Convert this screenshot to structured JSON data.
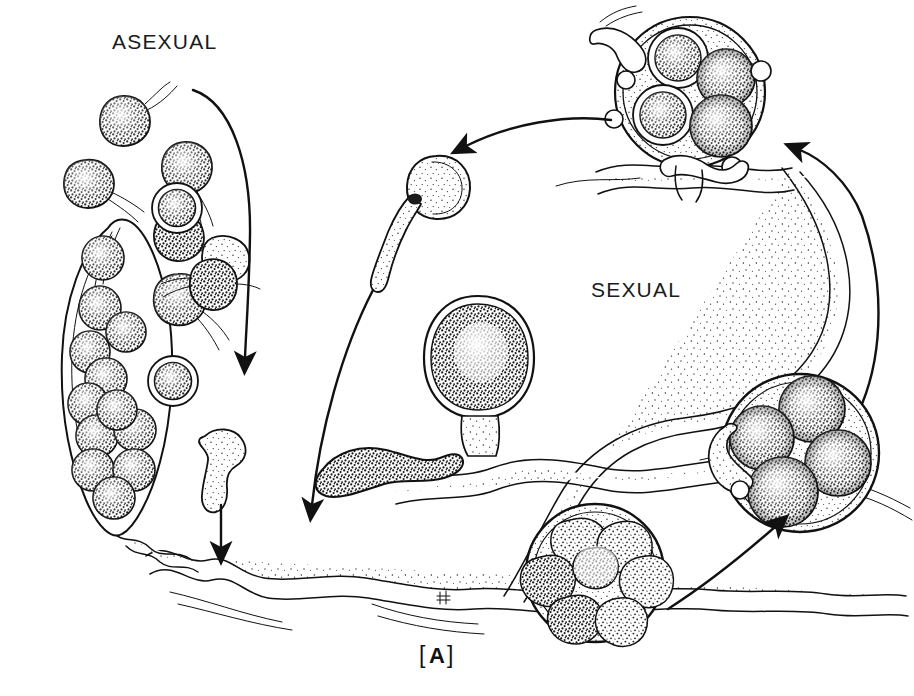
{
  "figure": {
    "plate_label_open": "[",
    "plate_label": "A",
    "plate_label_close": "]",
    "plate_label_full": "[A]",
    "background_color": "#ffffff",
    "ink_color": "#111111",
    "style": "pen-and-ink stipple line drawing"
  },
  "labels": {
    "asexual": "ASEXUAL",
    "sexual": "SEXUAL"
  },
  "signature": {
    "mark": "H"
  },
  "diagram_data": {
    "type": "cycle-diagram",
    "title": "Life cycle of an oomycete showing asexual and sexual pathways",
    "halves": [
      {
        "name": "asexual",
        "label": "ASEXUAL",
        "label_position": {
          "x": 160,
          "y": 72
        },
        "side": "left",
        "stage_count": 5
      },
      {
        "name": "sexual",
        "label": "SEXUAL",
        "label_position": {
          "x": 625,
          "y": 289
        },
        "side": "right",
        "stage_count": 5
      }
    ],
    "stages": [
      {
        "id": "sporangium",
        "pathway": "asexual",
        "name": "zoosporangium",
        "shape": "elongate-lemon",
        "center": {
          "x": 112,
          "y": 390
        },
        "width": 110,
        "height": 330,
        "spore_count": 12,
        "notes": "borne terminally on a hypha; packed with stippled spores"
      },
      {
        "id": "zoospores",
        "pathway": "asexual",
        "name": "biflagellate zoospores",
        "shape": "reniform-pip",
        "count": 7,
        "flagella_per_cell": 2,
        "positions": [
          {
            "x": 124,
            "y": 115
          },
          {
            "x": 186,
            "y": 157
          },
          {
            "x": 88,
            "y": 176
          },
          {
            "x": 178,
            "y": 234
          },
          {
            "x": 178,
            "y": 294
          },
          {
            "x": 222,
            "y": 252
          },
          {
            "x": 206,
            "y": 450
          }
        ]
      },
      {
        "id": "cysts",
        "pathway": "asexual",
        "name": "encysted zoospores",
        "shape": "double-walled-sphere",
        "count": 2,
        "positions": [
          {
            "x": 177,
            "y": 208
          },
          {
            "x": 173,
            "y": 381
          }
        ]
      },
      {
        "id": "amoeboid",
        "pathway": "asexual",
        "name": "amoeboid germling",
        "shape": "lobed-comma",
        "center": {
          "x": 221,
          "y": 455
        }
      },
      {
        "id": "germ-tube-cyst",
        "pathway": "shared",
        "name": "germinating cyst with germ tube",
        "shape": "sphere-with-tube",
        "center": {
          "x": 438,
          "y": 188
        },
        "tube_length": 95
      },
      {
        "id": "young-oogonium",
        "pathway": "sexual",
        "name": "young oogonium with antheridium",
        "shape": "ovoid-on-stalk",
        "center": {
          "x": 478,
          "y": 358
        },
        "width": 96,
        "height": 120
      },
      {
        "id": "antheridium-branch",
        "pathway": "sexual",
        "name": "antheridium branch",
        "shape": "club-lobe",
        "center": {
          "x": 372,
          "y": 470
        }
      },
      {
        "id": "oogonium-multispore",
        "pathway": "sexual",
        "name": "oogonium with developing oospores",
        "shape": "sphere",
        "center": {
          "x": 595,
          "y": 573
        },
        "radius": 68,
        "oospore_count": 7
      },
      {
        "id": "oogonium-four-oospores-right",
        "pathway": "sexual",
        "name": "oogonium containing four mature oospores",
        "shape": "sphere",
        "center": {
          "x": 800,
          "y": 453
        },
        "radius": 78,
        "oospore_count": 4
      },
      {
        "id": "oogonium-four-oospores-top",
        "pathway": "sexual",
        "name": "oogonium with four thick-walled oospores",
        "shape": "sphere",
        "center": {
          "x": 690,
          "y": 92
        },
        "radius": 74,
        "oospore_count": 4
      }
    ],
    "mycelium": {
      "name": "coenocytic hypha network",
      "texture": "stippled",
      "strand_count": 9
    },
    "arrows": [
      {
        "id": "arrow-asexual-descend",
        "from": "ASEXUAL label",
        "to": "zoospore field",
        "shape": "long-curve",
        "direction": "down",
        "head": {
          "x": 245,
          "y": 372
        }
      },
      {
        "id": "arrow-amoeboid-to-hypha",
        "from": "amoeboid germling",
        "to": "mycelium",
        "shape": "straight",
        "direction": "down",
        "head": {
          "x": 221,
          "y": 562
        }
      },
      {
        "id": "arrow-germcyst-to-hypha",
        "from": "germinating cyst",
        "to": "mycelium",
        "shape": "long-curve",
        "direction": "down-left",
        "head": {
          "x": 312,
          "y": 520
        }
      },
      {
        "id": "arrow-oogonium-to-germcyst",
        "from": "top oogonium",
        "to": "germinating cyst",
        "shape": "arc",
        "direction": "left",
        "head": {
          "x": 455,
          "y": 152
        }
      },
      {
        "id": "arrow-right-ascend",
        "from": "right oogonium",
        "to": "top oogonium",
        "shape": "long-curve",
        "direction": "up",
        "head": {
          "x": 793,
          "y": 144
        }
      },
      {
        "id": "arrow-bottom-to-right",
        "from": "bottom oogonium",
        "to": "right oogonium",
        "shape": "curve",
        "direction": "up-right",
        "head": {
          "x": 785,
          "y": 518
        }
      }
    ]
  }
}
